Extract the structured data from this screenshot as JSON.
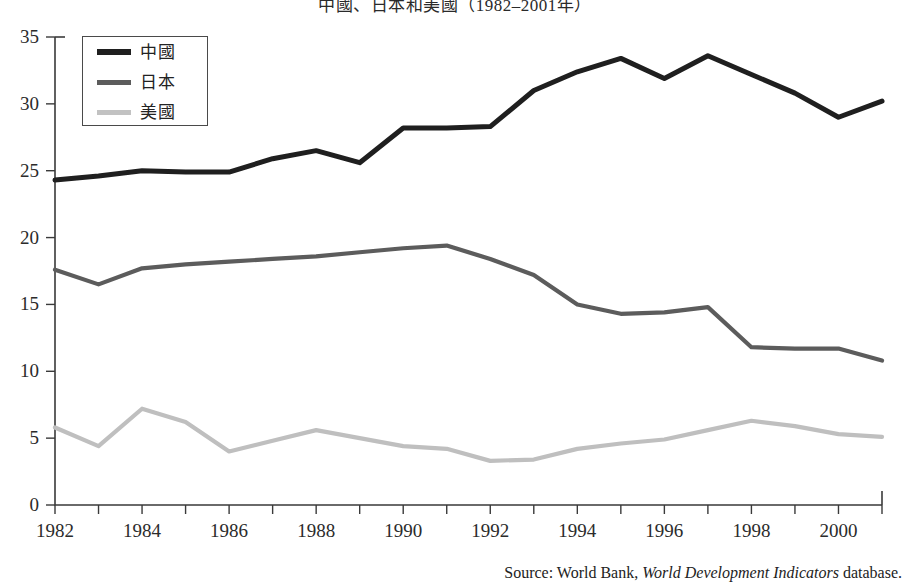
{
  "chart_data": {
    "type": "line",
    "title": "中國、日本和美國（1982–2001年）",
    "xlabel": "",
    "ylabel": "",
    "xlim": [
      1982,
      2001
    ],
    "ylim": [
      0,
      35
    ],
    "ytick_step": 5,
    "grid": false,
    "legend_position": "top-left",
    "x": [
      1982,
      1983,
      1984,
      1985,
      1986,
      1987,
      1988,
      1989,
      1990,
      1991,
      1992,
      1993,
      1994,
      1995,
      1996,
      1997,
      1998,
      1999,
      2000,
      2001
    ],
    "xtick_labels": [
      "1982",
      "",
      "1984",
      "",
      "1986",
      "",
      "1988",
      "",
      "1990",
      "",
      "1992",
      "",
      "1994",
      "",
      "1996",
      "",
      "1998",
      "",
      "2000",
      ""
    ],
    "ytick_labels": [
      "0",
      "5",
      "10",
      "15",
      "20",
      "25",
      "30",
      "35"
    ],
    "ytick_values": [
      0,
      5,
      10,
      15,
      20,
      25,
      30,
      35
    ],
    "series": [
      {
        "name": "中國",
        "color": "#1f1f1f",
        "width": 5.0,
        "values": [
          24.3,
          24.6,
          25.0,
          24.9,
          24.9,
          25.9,
          26.5,
          25.6,
          28.2,
          28.2,
          28.3,
          31.0,
          32.4,
          33.4,
          31.9,
          33.6,
          32.2,
          30.8,
          29.0,
          30.2
        ]
      },
      {
        "name": "日本",
        "color": "#5c5c5c",
        "width": 4.2,
        "values": [
          17.6,
          16.5,
          17.7,
          18.0,
          18.2,
          18.4,
          18.6,
          18.9,
          19.2,
          19.4,
          18.4,
          17.2,
          15.0,
          14.3,
          14.4,
          14.8,
          11.8,
          11.7,
          11.7,
          10.8
        ]
      },
      {
        "name": "美國",
        "color": "#bfbfbf",
        "width": 4.2,
        "values": [
          5.8,
          4.4,
          7.2,
          6.2,
          4.0,
          4.8,
          5.6,
          5.0,
          4.4,
          4.2,
          3.3,
          3.4,
          4.2,
          4.6,
          4.9,
          5.6,
          6.3,
          5.9,
          5.3,
          5.1
        ]
      }
    ]
  },
  "legend": {
    "items": [
      {
        "label": "中國",
        "color": "#1f1f1f",
        "thickness": "6px"
      },
      {
        "label": "日本",
        "color": "#5c5c5c",
        "thickness": "5px"
      },
      {
        "label": "美國",
        "color": "#c2c2c2",
        "thickness": "5px"
      }
    ]
  },
  "source": {
    "prefix": "Source: World Bank, ",
    "italic": "World Development Indicators",
    "suffix": " database."
  }
}
